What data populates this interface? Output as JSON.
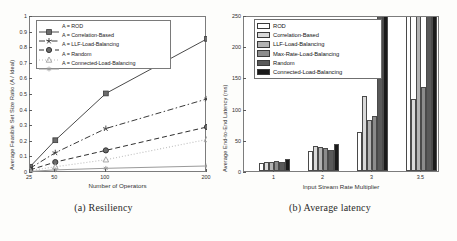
{
  "figure": {
    "panel_a_caption": "(a) Resiliency",
    "panel_b_caption": "(b) Average latency"
  },
  "chart_data": [
    {
      "id": "resiliency",
      "type": "line",
      "title": "",
      "xlabel": "Number of Operators",
      "ylabel": "Average Feasible Set Size Ratio (A / Ideal)",
      "x": [
        25,
        50,
        100,
        200
      ],
      "xticklabels": [
        "25",
        "50",
        "100",
        "200"
      ],
      "yticklabels": [
        "0",
        "0.1",
        "0.2",
        "0.3",
        "0.4",
        "0.5",
        "0.6",
        "0.7",
        "0.8",
        "0.9",
        "1"
      ],
      "ylim": [
        0,
        1
      ],
      "grid": false,
      "legend_position": "upper-left",
      "series": [
        {
          "name": "A = ROD",
          "marker": "square",
          "linestyle": "solid",
          "values": [
            0.04,
            0.21,
            0.51,
            0.86
          ]
        },
        {
          "name": "A = Correlation-Based",
          "marker": "star",
          "linestyle": "dashdot",
          "values": [
            0.03,
            0.13,
            0.285,
            0.475
          ]
        },
        {
          "name": "A = LLF-Load-Balancing",
          "marker": "circle",
          "linestyle": "dashed",
          "values": [
            0.02,
            0.07,
            0.145,
            0.295
          ]
        },
        {
          "name": "A = Random",
          "marker": "triangle",
          "linestyle": "dotted",
          "values": [
            0.015,
            0.04,
            0.085,
            0.215
          ]
        },
        {
          "name": "A = Connected-Load-Balancing",
          "marker": "asterisk",
          "linestyle": "solid",
          "values": [
            0.01,
            0.02,
            0.03,
            0.045
          ]
        }
      ]
    },
    {
      "id": "average-latency",
      "type": "bar",
      "title": "",
      "xlabel": "Input Stream Rate Multiplier",
      "ylabel": "Average End-to-End Latency (ms)",
      "categories": [
        "1",
        "2",
        "3",
        "3.5"
      ],
      "yticklabels": [
        "0",
        "50",
        "100",
        "150",
        "200",
        "250"
      ],
      "ylim": [
        0,
        250
      ],
      "grid": false,
      "legend_position": "upper-left",
      "series": [
        {
          "name": "ROD",
          "color": "#ffffff",
          "values": [
            13,
            32,
            62,
            250
          ]
        },
        {
          "name": "Correlation-Based",
          "color": "#d9d9d9",
          "values": [
            15,
            40,
            120,
            115
          ]
        },
        {
          "name": "LLF-Load-Balancing",
          "color": "#b3b3b3",
          "values": [
            14,
            38,
            82,
            250
          ]
        },
        {
          "name": "Max-Rate-Load-Balancing",
          "color": "#8c8c8c",
          "values": [
            16,
            37,
            88,
            135
          ]
        },
        {
          "name": "Random",
          "color": "#595959",
          "values": [
            14,
            33,
            250,
            250
          ]
        },
        {
          "name": "Connected-Load-Balancing",
          "color": "#1a1a1a",
          "values": [
            20,
            44,
            250,
            250
          ]
        }
      ]
    }
  ]
}
